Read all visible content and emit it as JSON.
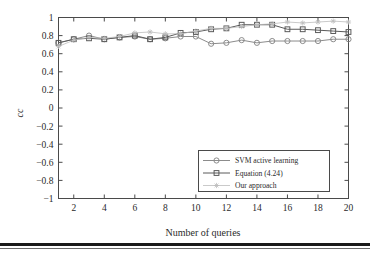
{
  "figure": {
    "name": "cc-vs-number-of-queries-plot"
  },
  "chart_data": {
    "type": "line",
    "title": "",
    "xlabel": "Number of queries",
    "ylabel": "cc",
    "xlim": [
      1,
      20
    ],
    "ylim": [
      -1,
      1
    ],
    "grid": false,
    "legend_position": "lower right",
    "xticks": [
      2,
      4,
      6,
      8,
      10,
      12,
      14,
      16,
      18,
      20
    ],
    "xtick_labels": [
      "2",
      "4",
      "6",
      "8",
      "10",
      "12",
      "14",
      "16",
      "18",
      "20"
    ],
    "yticks": [
      -1,
      -0.8,
      -0.6,
      -0.4,
      -0.2,
      0,
      0.2,
      0.4,
      0.6,
      0.8,
      1
    ],
    "ytick_labels": [
      "−1",
      "−0.8",
      "−0.6",
      "−0.4",
      "−0.2",
      "0",
      "0.2",
      "0.4",
      "0.6",
      "0.8",
      "1"
    ],
    "x": [
      1,
      2,
      3,
      4,
      5,
      6,
      7,
      8,
      9,
      10,
      11,
      12,
      13,
      14,
      15,
      16,
      17,
      18,
      19,
      20
    ],
    "series": [
      {
        "name": "SVM active learning",
        "marker": "circle",
        "color": "#8c8c8c",
        "values": [
          0.72,
          0.76,
          0.8,
          0.76,
          0.78,
          0.79,
          0.76,
          0.77,
          0.79,
          0.79,
          0.71,
          0.72,
          0.75,
          0.72,
          0.74,
          0.74,
          0.74,
          0.74,
          0.76,
          0.76
        ]
      },
      {
        "name": "Equation (4.24)",
        "marker": "square",
        "color": "#5a5a5a",
        "values": [
          0.72,
          0.76,
          0.77,
          0.76,
          0.78,
          0.8,
          0.76,
          0.78,
          0.83,
          0.84,
          0.87,
          0.88,
          0.92,
          0.92,
          0.92,
          0.87,
          0.87,
          0.86,
          0.85,
          0.84
        ]
      },
      {
        "name": "Our approach",
        "marker": "star",
        "color": "#bcbcbc",
        "values": [
          0.68,
          0.75,
          0.78,
          0.77,
          0.79,
          0.83,
          0.84,
          0.82,
          0.82,
          0.85,
          0.88,
          0.88,
          0.9,
          0.92,
          0.93,
          0.95,
          0.94,
          0.95,
          0.96,
          0.95
        ]
      }
    ]
  },
  "legend": {
    "items": [
      {
        "label": "SVM active learning",
        "marker": "circle",
        "color": "#8c8c8c"
      },
      {
        "label": "Equation (4.24)",
        "marker": "square",
        "color": "#5a5a5a"
      },
      {
        "label": "Our approach",
        "marker": "star",
        "color": "#bcbcbc"
      }
    ]
  },
  "colors": {
    "axis": "#4a4a4a",
    "text": "#2a2a2a",
    "background": "#ffffff",
    "rule": "#1a1a1a"
  }
}
